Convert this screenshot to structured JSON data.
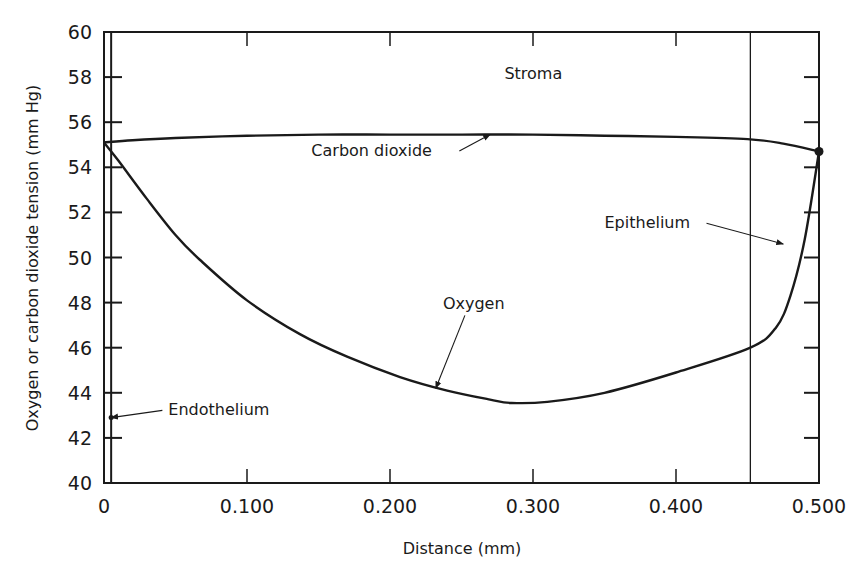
{
  "chart_data": {
    "type": "line",
    "title": "",
    "xlabel": "Distance (mm)",
    "ylabel": "Oxygen or carbon dioxide tension (mm Hg)",
    "xlim": [
      0,
      0.5
    ],
    "ylim": [
      40,
      60
    ],
    "grid": false,
    "legend": "none (curves labeled directly with annotations)",
    "x_ticks": [
      0,
      0.1,
      0.2,
      0.3,
      0.4,
      0.5
    ],
    "x_tick_labels": [
      "0",
      "0.100",
      "0.200",
      "0.300",
      "0.400",
      "0.500"
    ],
    "y_ticks": [
      40,
      42,
      44,
      46,
      48,
      50,
      52,
      54,
      56,
      58,
      60
    ],
    "y_tick_labels": [
      "40",
      "42",
      "44",
      "46",
      "48",
      "50",
      "52",
      "54",
      "56",
      "58",
      "60"
    ],
    "series": [
      {
        "name": "Carbon dioxide",
        "x": [
          0.0,
          0.02,
          0.05,
          0.1,
          0.15,
          0.2,
          0.25,
          0.3,
          0.35,
          0.4,
          0.45,
          0.475,
          0.5
        ],
        "values": [
          55.1,
          55.2,
          55.3,
          55.4,
          55.45,
          55.45,
          55.45,
          55.45,
          55.4,
          55.35,
          55.25,
          55.05,
          54.7
        ]
      },
      {
        "name": "Oxygen",
        "x": [
          0.0,
          0.01,
          0.03,
          0.05,
          0.067,
          0.1,
          0.137,
          0.17,
          0.207,
          0.24,
          0.27,
          0.285,
          0.31,
          0.35,
          0.4,
          0.452,
          0.47,
          0.48,
          0.49,
          0.5
        ],
        "values": [
          55.1,
          54.3,
          52.6,
          51.0,
          49.9,
          48.1,
          46.6,
          45.6,
          44.7,
          44.1,
          43.7,
          43.55,
          43.6,
          44.0,
          44.9,
          46.0,
          46.9,
          48.3,
          50.8,
          54.7
        ]
      }
    ],
    "boundaries": [
      {
        "name": "Endothelium",
        "x": 0.005
      },
      {
        "name": "Epithelium",
        "x": 0.452
      }
    ],
    "annotations": [
      {
        "text": "Stroma",
        "x": 0.28,
        "y": 57.9,
        "arrow": false
      },
      {
        "text": "Carbon dioxide",
        "x": 0.145,
        "y": 54.5,
        "arrow_to": {
          "x": 0.27,
          "y": 55.45
        }
      },
      {
        "text": "Oxygen",
        "x": 0.237,
        "y": 47.7,
        "arrow_to": {
          "x": 0.232,
          "y": 44.2
        }
      },
      {
        "text": "Epithelium",
        "x": 0.35,
        "y": 51.3,
        "arrow_to": {
          "x": 0.475,
          "y": 50.6
        }
      },
      {
        "text": "Endothelium",
        "x": 0.045,
        "y": 43.0,
        "arrow_to": {
          "x": 0.005,
          "y": 42.9
        }
      }
    ],
    "markers": [
      {
        "name": "right-end-dot",
        "x": 0.5,
        "y": 54.7
      }
    ]
  },
  "axis": {
    "x_title": "Distance (mm)",
    "y_title": "Oxygen or carbon dioxide tension (mm Hg)"
  },
  "labels": {
    "stroma": "Stroma",
    "carbon_dioxide": "Carbon dioxide",
    "oxygen": "Oxygen",
    "epithelium": "Epithelium",
    "endothelium": "Endothelium"
  },
  "colors": {
    "ink": "#1a1a1a",
    "background": "#ffffff"
  }
}
